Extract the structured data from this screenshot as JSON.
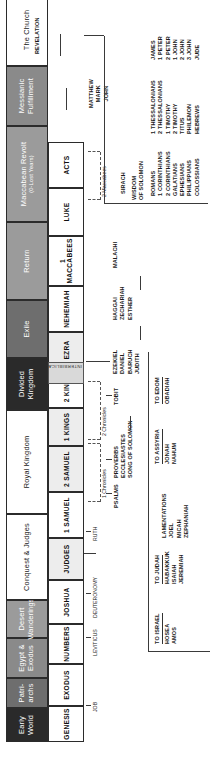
{
  "periods": [
    {
      "label": "Early World",
      "tone": "dark",
      "w": 34
    },
    {
      "label": "Patri- archs",
      "tone": "mid",
      "w": 30
    },
    {
      "label": "Egypt & Exodus",
      "tone": "mid2",
      "w": 40
    },
    {
      "label": "Desert Wanderings",
      "tone": "grey",
      "w": 38
    },
    {
      "label": "Conquest & Judges",
      "tone": "light",
      "w": 86
    },
    {
      "label": "Royal Kingdom",
      "tone": "light",
      "w": 104
    },
    {
      "label": "Divided Kingdom",
      "tone": "dark",
      "w": 52
    },
    {
      "label": "Exile",
      "tone": "mid",
      "w": 58
    },
    {
      "label": "Return",
      "tone": "grey",
      "w": 78
    },
    {
      "label": "Maccabean Revolt",
      "sub": "(0-Lost Years)",
      "tone": "grey",
      "w": 96
    },
    {
      "label": "Messianic Fulfillment",
      "tone": "mid2",
      "w": 60
    },
    {
      "label": "The Church",
      "tone": "light",
      "w": 72
    }
  ],
  "books": [
    {
      "label": "GENESIS",
      "w": 36,
      "shade": false
    },
    {
      "label": "EXODUS",
      "w": 42,
      "shade": false
    },
    {
      "label": "LEVITICUS",
      "w": 0,
      "shade": false
    },
    {
      "label": "NUMBERS",
      "w": 40,
      "shade": false
    },
    {
      "label": "JOSHUA",
      "w": 40,
      "shade": false
    },
    {
      "label": "JUDGES",
      "w": 40,
      "shade": true
    },
    {
      "label": "1 SAMUEL",
      "w": 42,
      "shade": false
    },
    {
      "label": "2 SAMUEL",
      "w": 42,
      "shade": true
    },
    {
      "label": "1 KINGS",
      "w": 36,
      "shade": true
    },
    {
      "label": "2 KINGS",
      "w": 40,
      "shade": false
    },
    {
      "label": "EZRA",
      "w": 34,
      "shade": true
    },
    {
      "label": "NEHEMIAH",
      "w": 44,
      "shade": false
    },
    {
      "label": "1 MACCABEES",
      "w": 46,
      "shade": false
    },
    {
      "label": "LUKE",
      "w": 46,
      "shade": false
    },
    {
      "label": "ACTS",
      "w": 44,
      "shade": false
    }
  ],
  "between_books": [
    {
      "label": "LEVITICUS"
    },
    {
      "label": "DEUTERONOMY"
    },
    {
      "label": "RUTH"
    },
    {
      "label": "JOB"
    }
  ],
  "interbiblical": {
    "label": "INTERBIBLICAL"
  },
  "writings": {
    "chronicles_1": "1 Chronicles",
    "chronicles_2": "2 Chronicles",
    "maccabees_2": "2 Maccabees",
    "wisdom_left": "PSALMS",
    "wisdom_mid": "PROVERBS",
    "wisdom_lines": "ECCLESIASTES\nSONG OF SOLOMON",
    "tobit": "TOBIT",
    "exile_books": "EZEKIEL\nDANIEL\nBARUCH\nJUDITH",
    "return_books": "HAGGAI\nZECHARIAH\nESTHER",
    "malachi": "MALACHI",
    "sirach": "SIRACH",
    "wisdom_of_solomon": "WISDOM\nOF SOLOMON"
  },
  "prophet_groups": [
    {
      "title": "TO ISRAEL",
      "books": "HOSEA\nAMOS"
    },
    {
      "title": "TO JUDAH",
      "books": "HABAKKUK\nISAIAH\nJEREMIAH"
    },
    {
      "title": "",
      "books": "LAMENTATIONS\nJOEL\nMICAH\nZEPHANIAH"
    },
    {
      "title": "TO ASSYRIA",
      "books": "JONAH\nNAHUM"
    },
    {
      "title": "TO EDOM",
      "books": "OBADIAH"
    }
  ],
  "gospels": "MATTHEW\nMARK\nJOHN",
  "revelation": "REVELATION",
  "epistles": [
    {
      "books": "ROMANS\n1 CORINTHIANS\n2 CORINTHIANS\nGALATIANS\nEPHESIANS\nPHILIPPIANS\nCOLOSSIANS"
    },
    {
      "books": "1 THESSALONIANS\n2 THESSALONIANS\n1 TIMOTHY\n2 TIMOTHY\nTITUS\nPHILEMON\nHEBREWS"
    },
    {
      "books": "JAMES\n1 PETER\n2 PETER\n1 JOHN\n2 JOHN\n3 JOHN\nJUDE"
    }
  ],
  "colors": {
    "dark": "#2a2a2a",
    "mid": "#6e6e6e",
    "grey": "#9b9b9b",
    "line": "#3a3a3a"
  }
}
